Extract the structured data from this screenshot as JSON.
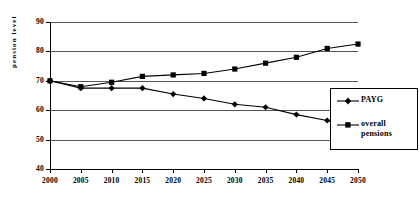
{
  "chart_data": {
    "type": "line",
    "title": "",
    "xlabel": "",
    "ylabel": "pension level",
    "categories": [
      2000,
      2005,
      2010,
      2015,
      2020,
      2025,
      2030,
      2035,
      2040,
      2045,
      2050
    ],
    "xtick_labels": [
      "2000",
      "2005",
      "2010",
      "2015",
      "2020",
      "2025",
      "2030",
      "2035",
      "2040",
      "2045",
      "2050"
    ],
    "ytick_labels": [
      "90",
      "80",
      "70",
      "60",
      "50",
      "40"
    ],
    "ylim": [
      40,
      90
    ],
    "ytick_values": [
      90,
      80,
      70,
      60,
      50,
      40
    ],
    "grid": true,
    "legend_position": "right",
    "series": [
      {
        "name": "PAYG",
        "marker": "diamond",
        "color": "#000000",
        "values": [
          70.0,
          67.5,
          67.5,
          67.5,
          65.5,
          64.0,
          62.0,
          61.0,
          58.5,
          56.5,
          54.0
        ]
      },
      {
        "name": "overall pensions",
        "marker": "square",
        "color": "#000000",
        "values": [
          70.0,
          68.0,
          69.5,
          71.5,
          72.0,
          72.5,
          74.0,
          76.0,
          78.0,
          81.0,
          82.5
        ]
      }
    ]
  },
  "legend": {
    "entries": [
      {
        "label": "PAYG",
        "label_line2": ""
      },
      {
        "label": "overall",
        "label_line2": "pensions"
      }
    ]
  }
}
